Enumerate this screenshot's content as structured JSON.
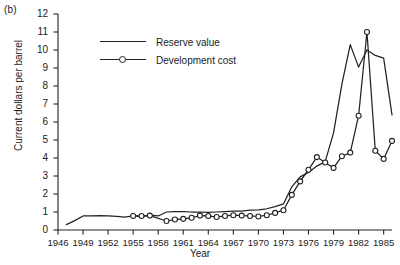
{
  "panel": {
    "label": "(b)"
  },
  "axes": {
    "xlabel": "Year",
    "ylabel": "Current dollars per barrel",
    "yticks": [
      "0",
      "1",
      "2",
      "3",
      "4",
      "5",
      "6",
      "7",
      "8",
      "9",
      "10",
      "11",
      "12"
    ],
    "xticks": [
      "1946",
      "1949",
      "1952",
      "1955",
      "1958",
      "1961",
      "1964",
      "1967",
      "1970",
      "1973",
      "1976",
      "1979",
      "1982",
      "1985"
    ]
  },
  "legend": {
    "items": [
      {
        "label": "Reserve value",
        "style": "line"
      },
      {
        "label": "Development cost",
        "style": "line-marker"
      }
    ]
  },
  "chart_data": {
    "type": "line",
    "title": "",
    "xlabel": "Year",
    "ylabel": "Current dollars per barrel",
    "xlim": [
      1946,
      1986
    ],
    "ylim": [
      0,
      12
    ],
    "grid": false,
    "legend_position": "upper-left-inside",
    "xticks": [
      1946,
      1949,
      1952,
      1955,
      1958,
      1961,
      1964,
      1967,
      1970,
      1973,
      1976,
      1979,
      1982,
      1985
    ],
    "yticks": [
      0,
      1,
      2,
      3,
      4,
      5,
      6,
      7,
      8,
      9,
      10,
      11,
      12
    ],
    "series": [
      {
        "name": "Reserve value",
        "marker": "none",
        "color": "#222222",
        "x": [
          1947,
          1948,
          1949,
          1950,
          1951,
          1952,
          1953,
          1954,
          1955,
          1956,
          1957,
          1958,
          1959,
          1960,
          1961,
          1962,
          1963,
          1964,
          1965,
          1966,
          1967,
          1968,
          1969,
          1970,
          1971,
          1972,
          1973,
          1974,
          1975,
          1976,
          1977,
          1978,
          1979,
          1980,
          1981,
          1982,
          1983,
          1984,
          1985,
          1986
        ],
        "values": [
          0.3,
          0.52,
          0.78,
          0.78,
          0.8,
          0.78,
          0.76,
          0.72,
          0.78,
          0.74,
          0.82,
          0.78,
          1.0,
          1.02,
          1.02,
          1.0,
          1.0,
          0.98,
          1.0,
          1.02,
          1.05,
          1.05,
          1.1,
          1.12,
          1.18,
          1.3,
          1.45,
          2.4,
          2.95,
          3.2,
          3.55,
          3.8,
          5.4,
          8.1,
          10.3,
          9.05,
          10.0,
          9.7,
          9.55,
          6.4
        ]
      },
      {
        "name": "Development cost",
        "marker": "circle-open",
        "color": "#222222",
        "x": [
          1955,
          1956,
          1957,
          1959,
          1960,
          1961,
          1962,
          1963,
          1964,
          1965,
          1966,
          1967,
          1968,
          1969,
          1970,
          1971,
          1972,
          1973,
          1974,
          1975,
          1976,
          1977,
          1978,
          1979,
          1980,
          1981,
          1982,
          1983,
          1984,
          1985,
          1986
        ],
        "values": [
          0.78,
          0.78,
          0.8,
          0.5,
          0.58,
          0.62,
          0.68,
          0.8,
          0.78,
          0.72,
          0.78,
          0.82,
          0.8,
          0.78,
          0.75,
          0.82,
          0.95,
          1.1,
          1.95,
          2.7,
          3.35,
          4.05,
          3.75,
          3.45,
          4.1,
          4.3,
          6.35,
          11.0,
          4.4,
          3.95,
          4.95
        ]
      }
    ]
  }
}
